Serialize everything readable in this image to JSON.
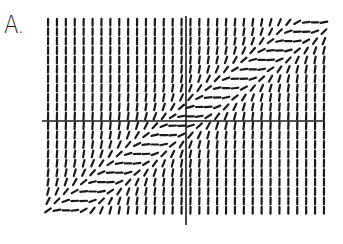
{
  "figure": {
    "label": "A."
  },
  "chart_data": {
    "type": "slope_field",
    "title": "A.",
    "equation_model": "dy/dx = (y - x)^2",
    "x_range": [
      -16,
      15
    ],
    "y_range": [
      -10,
      11
    ],
    "x_axis_visible": true,
    "y_axis_visible": true,
    "tick_labels": [],
    "colors": {
      "ink": "#1a1a1a",
      "background": "#ffffff"
    }
  }
}
